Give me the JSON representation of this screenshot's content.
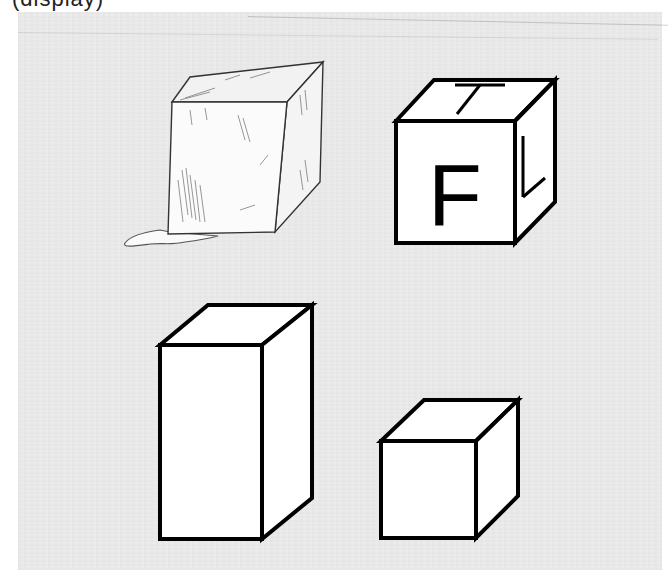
{
  "caption": {
    "text": "(display)",
    "clipped": true
  },
  "panel": {
    "background": "#ebebeb",
    "page_background": "#ffffff"
  },
  "figures": [
    {
      "id": "ice-cube",
      "description": "Pencil-sketched ice cube melting into a small puddle",
      "style": "sketch"
    },
    {
      "id": "letter-cube",
      "description": "Line-drawn cube with letters on visible faces",
      "faces": {
        "front": "F",
        "top": "T",
        "right": "L"
      }
    },
    {
      "id": "rectangular-prism",
      "description": "Tall rectangular prism (box) line drawing"
    },
    {
      "id": "small-cube",
      "description": "Small cube line drawing"
    }
  ],
  "colors": {
    "stroke": "#000000",
    "face_fill": "#ffffff",
    "sketch_shade": "#6b6b6b"
  }
}
